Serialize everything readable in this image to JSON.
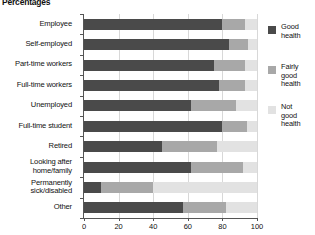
{
  "chart_data": {
    "type": "bar",
    "orientation": "horizontal",
    "stacked": true,
    "title": "Percentages",
    "xlabel": "",
    "ylabel": "",
    "xlim": [
      0,
      100
    ],
    "xticks": [
      0,
      20,
      40,
      60,
      80,
      100
    ],
    "grid": true,
    "legend_position": "right",
    "categories": [
      "Employee",
      "Self-employed",
      "Part-time workers",
      "Full-time workers",
      "Unemployed",
      "Full-time student",
      "Retired",
      "Looking after\nhome/family",
      "Permanently\nsick/disabled",
      "Other"
    ],
    "series": [
      {
        "name": "Good health",
        "color": "#4a4a4a",
        "values": [
          80,
          84,
          75,
          78,
          62,
          80,
          45,
          62,
          10,
          57
        ]
      },
      {
        "name": "Fairly good health",
        "color": "#a8a8a8",
        "values": [
          13,
          11,
          18,
          15,
          26,
          14,
          32,
          30,
          30,
          25
        ]
      },
      {
        "name": "Not good health",
        "color": "#e2e2e2",
        "values": [
          7,
          5,
          7,
          7,
          12,
          6,
          23,
          8,
          60,
          18
        ]
      }
    ]
  },
  "legend": {
    "items": [
      {
        "label": "Good\nhealth",
        "color": "#4a4a4a"
      },
      {
        "label": "Fairly\ngood\nhealth",
        "color": "#a8a8a8"
      },
      {
        "label": "Not\ngood\nhealth",
        "color": "#e2e2e2"
      }
    ]
  }
}
